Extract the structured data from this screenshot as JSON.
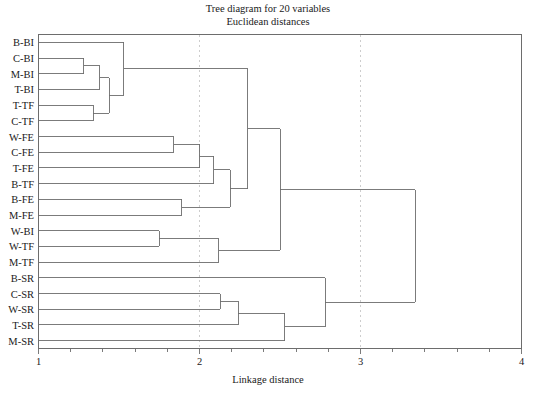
{
  "title": {
    "line1": "Tree diagram for 20 variables",
    "line2": "Euclidean distances"
  },
  "axis": {
    "x_title": "Linkage distance",
    "x_ticks": [
      "1",
      "2",
      "3",
      "4"
    ],
    "x_tick_values": [
      1,
      2,
      3,
      4
    ],
    "gridlines": [
      2,
      3
    ]
  },
  "colors": {
    "line": "#6d6d6d",
    "text": "#1a1a1a",
    "grid": "#c8c8c8",
    "background": "#ffffff"
  },
  "chart_data": {
    "type": "dendrogram",
    "title": "Tree diagram for 20 variables",
    "subtitle": "Euclidean distances",
    "xlabel": "Linkage distance",
    "ylabel": "",
    "xlim": [
      1,
      4
    ],
    "grid": true,
    "gridlines_at": [
      2,
      3
    ],
    "orientation": "horizontal",
    "leaf_order": [
      "B-BI",
      "C-BI",
      "M-BI",
      "T-BI",
      "T-TF",
      "C-TF",
      "W-FE",
      "C-FE",
      "T-FE",
      "B-TF",
      "B-FE",
      "M-FE",
      "W-BI",
      "W-TF",
      "M-TF",
      "B-SR",
      "C-SR",
      "W-SR",
      "T-SR",
      "M-SR"
    ],
    "leaves": [
      {
        "label": "B-BI",
        "index": 0
      },
      {
        "label": "C-BI",
        "index": 1
      },
      {
        "label": "M-BI",
        "index": 2
      },
      {
        "label": "T-BI",
        "index": 3
      },
      {
        "label": "T-TF",
        "index": 4
      },
      {
        "label": "C-TF",
        "index": 5
      },
      {
        "label": "W-FE",
        "index": 6
      },
      {
        "label": "C-FE",
        "index": 7
      },
      {
        "label": "T-FE",
        "index": 8
      },
      {
        "label": "B-TF",
        "index": 9
      },
      {
        "label": "B-FE",
        "index": 10
      },
      {
        "label": "M-FE",
        "index": 11
      },
      {
        "label": "W-BI",
        "index": 12
      },
      {
        "label": "W-TF",
        "index": 13
      },
      {
        "label": "M-TF",
        "index": 14
      },
      {
        "label": "B-SR",
        "index": 15
      },
      {
        "label": "C-SR",
        "index": 16
      },
      {
        "label": "W-SR",
        "index": 17
      },
      {
        "label": "T-SR",
        "index": 18
      },
      {
        "label": "M-SR",
        "index": 19
      }
    ],
    "merges": [
      {
        "id": "n1",
        "left": "C-BI",
        "right": "M-BI",
        "distance": 1.28
      },
      {
        "id": "n2",
        "left": "T-TF",
        "right": "C-TF",
        "distance": 1.34
      },
      {
        "id": "n3",
        "left": "n1",
        "right": "T-BI",
        "distance": 1.38
      },
      {
        "id": "n4",
        "left": "n3",
        "right": "n2",
        "distance": 1.44
      },
      {
        "id": "n5",
        "left": "B-BI",
        "right": "n4",
        "distance": 1.53
      },
      {
        "id": "n6",
        "left": "W-FE",
        "right": "C-FE",
        "distance": 1.84
      },
      {
        "id": "n7",
        "left": "W-BI",
        "right": "W-TF",
        "distance": 1.75
      },
      {
        "id": "n8",
        "left": "B-FE",
        "right": "M-FE",
        "distance": 1.89
      },
      {
        "id": "n9",
        "left": "n6",
        "right": "T-FE",
        "distance": 2.0
      },
      {
        "id": "n10",
        "left": "n9",
        "right": "B-TF",
        "distance": 2.09
      },
      {
        "id": "n11",
        "left": "n10",
        "right": "n8",
        "distance": 2.19
      },
      {
        "id": "n12",
        "left": "n5",
        "right": "n11",
        "distance": 2.3
      },
      {
        "id": "n13",
        "left": "n7",
        "right": "M-TF",
        "distance": 2.12
      },
      {
        "id": "n14",
        "left": "n12",
        "right": "n13",
        "distance": 2.5
      },
      {
        "id": "n15",
        "left": "C-SR",
        "right": "W-SR",
        "distance": 2.13
      },
      {
        "id": "n16",
        "left": "n15",
        "right": "T-SR",
        "distance": 2.24
      },
      {
        "id": "n17",
        "left": "n16",
        "right": "M-SR",
        "distance": 2.53
      },
      {
        "id": "n18",
        "left": "B-SR",
        "right": "n17",
        "distance": 2.78
      },
      {
        "id": "n19",
        "left": "n14",
        "right": "n18",
        "distance": 3.34
      }
    ]
  }
}
